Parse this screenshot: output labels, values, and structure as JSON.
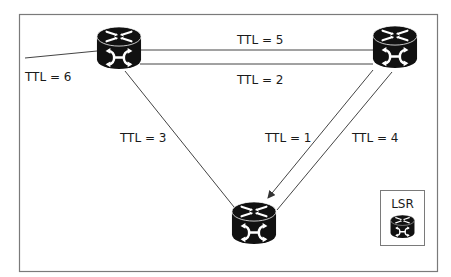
{
  "diagram": {
    "type": "network-topology",
    "colors": {
      "frame": "#7a7a7a",
      "edge": "#444444",
      "router": "#111111",
      "router_glyph": "#ffffff",
      "text": "#1a1a1a"
    },
    "nodes": [
      {
        "id": "lsr-top-left",
        "kind": "router",
        "cx": 119,
        "cy": 48
      },
      {
        "id": "lsr-top-right",
        "kind": "router",
        "cx": 395,
        "cy": 47
      },
      {
        "id": "lsr-bottom",
        "kind": "router",
        "cx": 254,
        "cy": 222
      }
    ],
    "edges": [
      {
        "from": "external",
        "to": "lsr-top-left",
        "label": "TTL = 6"
      },
      {
        "from": "lsr-top-left",
        "to": "lsr-top-right",
        "label": "TTL = 5"
      },
      {
        "from": "lsr-top-right",
        "to": "lsr-top-left",
        "label": "TTL = 2"
      },
      {
        "from": "lsr-top-left",
        "to": "lsr-bottom",
        "label": "TTL = 3"
      },
      {
        "from": "lsr-top-right",
        "to": "lsr-bottom",
        "label": "TTL = 1",
        "arrow": true
      },
      {
        "from": "lsr-bottom",
        "to": "lsr-top-right",
        "label": "TTL = 4"
      }
    ],
    "labels": {
      "ttl6": "TTL = 6",
      "ttl5": "TTL = 5",
      "ttl2": "TTL = 2",
      "ttl3": "TTL = 3",
      "ttl1": "TTL = 1",
      "ttl4": "TTL = 4"
    },
    "legend": {
      "title": "LSR",
      "icon": "router-icon"
    }
  }
}
